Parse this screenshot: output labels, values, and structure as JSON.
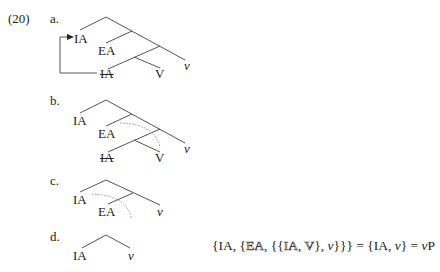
{
  "example": {
    "number": "(20)",
    "items": [
      {
        "letter": "a.",
        "labels": {
          "ia_moved": "IA",
          "ea": "EA",
          "ia_copy": "IA",
          "v_head": "V",
          "v_light": "v"
        },
        "description": "IA internally merged to root edge; lower IA copy struck out; arrow from lower IA to upper IA"
      },
      {
        "letter": "b.",
        "labels": {
          "ia": "IA",
          "ea": "EA",
          "ia_copy": "IA",
          "v_head": "V",
          "v_light": "v"
        },
        "description": "Dotted arc marks removal of {IA, V} constituent"
      },
      {
        "letter": "c.",
        "labels": {
          "ia": "IA",
          "ea": "EA",
          "v_light": "v"
        },
        "description": "Dotted arc marks removal of EA"
      },
      {
        "letter": "d.",
        "labels": {
          "ia": "IA",
          "v_light": "v"
        },
        "description": "Final structure {IA, v}"
      }
    ],
    "formula": {
      "open": "{IA, {",
      "ea": "EA",
      "mid1": ", {{",
      "ia": "IA",
      "comma": ", ",
      "v_cap": "V",
      "mid2": "}, ",
      "v1": "v",
      "close1": "}}} = {IA, ",
      "v2": "v",
      "close2": "} = ",
      "v3": "v",
      "p": "P"
    }
  },
  "colors": {
    "line": "#555555",
    "text": "#222222",
    "dotted": "#888888"
  }
}
